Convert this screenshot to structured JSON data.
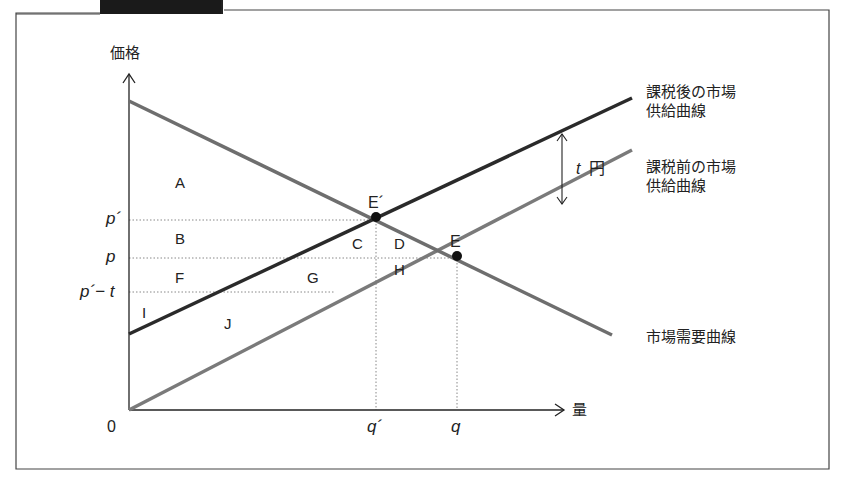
{
  "header": {
    "figure_caption": "図 5-7 課税による社会的余剰の変化"
  },
  "axes": {
    "y_label": "価格",
    "x_label": "量",
    "origin": "0"
  },
  "price_ticks": {
    "p_prime": "p´",
    "p": "p",
    "p_prime_minus_t": "p´− t"
  },
  "quantity_ticks": {
    "q_prime": "q´",
    "q": "q"
  },
  "points": {
    "e_prime": "E´",
    "e": "E"
  },
  "regions": {
    "a": "A",
    "b": "B",
    "c": "C",
    "d": "D",
    "f": "F",
    "g": "G",
    "h": "H",
    "i": "I",
    "j": "J"
  },
  "curves": {
    "after_tax_supply_line1": "課税後の市場",
    "after_tax_supply_line2": "供給曲線",
    "before_tax_supply_line1": "課税前の市場",
    "before_tax_supply_line2": "供給曲線",
    "demand": "市場需要曲線"
  },
  "tax_annotation": {
    "t": "t",
    "unit": "円"
  },
  "colors": {
    "demand": "#6e6e6e",
    "after_tax_supply": "#2a2a2a",
    "before_tax_supply": "#7a7a7a",
    "axis": "#222222",
    "guide": "#888888"
  }
}
